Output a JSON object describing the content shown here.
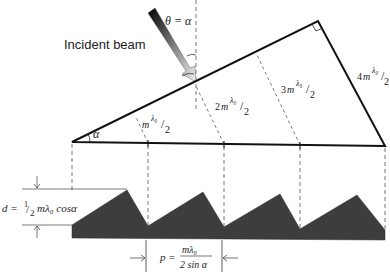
{
  "labels": {
    "incident_beam": "Incident beam",
    "theta_eq_alpha": "θ = α",
    "alpha": "α",
    "step1": {
      "coef": "",
      "m": "m",
      "lambda": "λ₀",
      "denom": "2"
    },
    "step2": {
      "coef": "2",
      "m": "m",
      "lambda": "λ₀",
      "denom": "2"
    },
    "step3": {
      "coef": "3",
      "m": "m",
      "lambda": "λ₀",
      "denom": "2"
    },
    "step4": {
      "coef": "4",
      "m": "m",
      "lambda": "λ₀",
      "denom": "2"
    },
    "depth_formula": {
      "lhs": "d =",
      "frac_num": "1",
      "frac_den": "2",
      "rhs": "mλ₀ cosα"
    },
    "period_formula": {
      "lhs": "p =",
      "num": "mλ₀",
      "den": "2 sin α"
    }
  },
  "geometry": {
    "triangle": {
      "left": [
        72,
        142
      ],
      "apex": [
        318,
        21
      ],
      "right": [
        385,
        146
      ]
    },
    "dashed_x": [
      72,
      148,
      224,
      300,
      385
    ],
    "grating_peaks": [
      [
        127,
        190
      ],
      [
        203,
        192
      ],
      [
        280,
        194
      ],
      [
        357,
        195
      ]
    ],
    "grating_valleys": [
      [
        148,
        226
      ],
      [
        224,
        227
      ],
      [
        300,
        229
      ],
      [
        385,
        230
      ]
    ],
    "grating_color": "#3d3d3d"
  }
}
